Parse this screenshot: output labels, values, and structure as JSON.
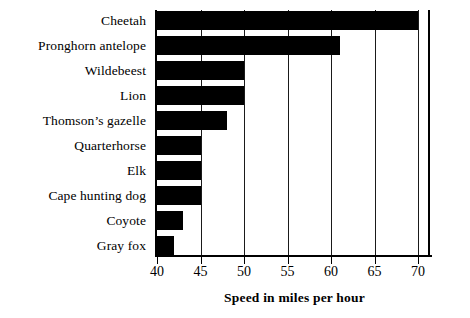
{
  "chart_data": {
    "type": "bar",
    "orientation": "horizontal",
    "title": "",
    "xlabel": "Speed in miles per hour",
    "ylabel": "",
    "xlim": [
      40,
      71.5
    ],
    "xticks": [
      40,
      45,
      50,
      55,
      60,
      65,
      70
    ],
    "grid": true,
    "legend": null,
    "bar_color": "#000000",
    "background_color": "#ffffff",
    "categories": [
      "Cheetah",
      "Pronghorn antelope",
      "Wildebeest",
      "Lion",
      "Thomson’s gazelle",
      "Quarterhorse",
      "Elk",
      "Cape hunting dog",
      "Coyote",
      "Gray fox"
    ],
    "values": [
      70,
      61,
      50,
      50,
      48,
      45,
      45,
      45,
      43,
      42
    ]
  }
}
